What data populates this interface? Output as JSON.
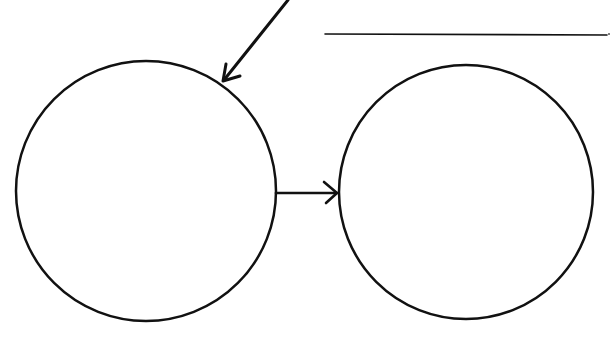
{
  "diagram": {
    "background": "#ffffff",
    "stroke_color": "#111111",
    "nodes": [
      {
        "id": "left-circle",
        "label": "",
        "cx": 146,
        "cy": 191,
        "r": 130
      },
      {
        "id": "right-circle",
        "label": "",
        "cx": 466,
        "cy": 192,
        "r": 127
      }
    ],
    "edges": [
      {
        "id": "incoming-arrow",
        "from": "top-edge",
        "to": "left-circle"
      },
      {
        "id": "connector-arrow",
        "from": "left-circle",
        "to": "right-circle"
      }
    ],
    "answer_line": {
      "label": ""
    }
  }
}
